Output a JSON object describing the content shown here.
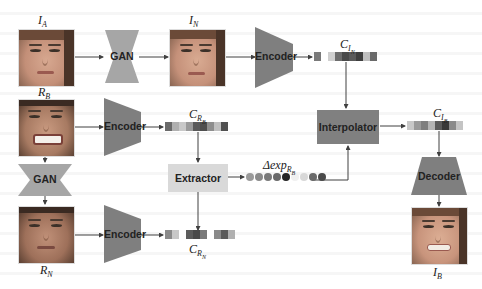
{
  "diagram": {
    "colors": {
      "gan": "#a6a6a6",
      "encoder": "#7f7f7f",
      "interpolator": "#808080",
      "extractor": "#d9d9d9",
      "decoder": "#7f7f7f",
      "arrow": "#404040"
    },
    "images": {
      "IA": {
        "label_main": "I",
        "label_sub": "A"
      },
      "IN": {
        "label_main": "I",
        "label_sub": "N"
      },
      "RB": {
        "label_main": "R",
        "label_sub": "B"
      },
      "RN": {
        "label_main": "R",
        "label_sub": "N"
      },
      "IB": {
        "label_main": "I",
        "label_sub": "B"
      }
    },
    "modules": {
      "gan_top": "GAN",
      "gan_left": "GAN",
      "encoder_top": "Encoder",
      "encoder_mid": "Encoder",
      "encoder_bottom": "Encoder",
      "interpolator": "Interpolator",
      "extractor": "Extractor",
      "decoder": "Decoder"
    },
    "codes": {
      "CIN": {
        "label_main": "C",
        "label_sub": "I",
        "label_subsub": "N",
        "cells": [
          "#7a7a7a",
          "#ffffff",
          "#d0d0d0",
          "#6d6d6d",
          "#4a4a4a",
          "#5a5a5a",
          "#3e3e3e",
          "#bfbfbf",
          "#6a6a6a"
        ]
      },
      "CRB": {
        "label_main": "C",
        "label_sub": "R",
        "label_subsub": "B",
        "cells": [
          "#6a6a6a",
          "#b0b0b0",
          "#c8c8c8",
          "#9a9a9a",
          "#5a5a5a",
          "#4e4e4e",
          "#8e8e8e",
          "#c0c0c0",
          "#505050"
        ]
      },
      "CIB": {
        "label_main": "C",
        "label_sub": "I",
        "label_subsub": "B",
        "cells": [
          "#c8c8c8",
          "#9a9a9a",
          "#7e7e7e",
          "#b4b4b4",
          "#5a5a5a",
          "#383838",
          "#8a8a8a",
          "#c4c4c4"
        ]
      },
      "CRN": {
        "label_main": "C",
        "label_sub": "R",
        "label_subsub": "N",
        "cells": [
          "#8a8a8a",
          "#c8c8c8",
          "#ffffff",
          "#5c5c5c",
          "#4a4a4a",
          "#7a7a7a",
          "#ffffff",
          "#8a8a8a",
          "#5a5a5a",
          "#b0b0b0"
        ]
      }
    },
    "delta_exp": {
      "label_prefix": "Δexp",
      "label_sub": "R",
      "label_subsub": "B",
      "dots": [
        "#9a9a9a",
        "#8a8a8a",
        "#7a7a7a",
        "#6a6a6a",
        "#262626",
        "#f0f0f0",
        "#d8d8d8",
        "#6a6a6a",
        "#4a4a4a"
      ]
    }
  }
}
